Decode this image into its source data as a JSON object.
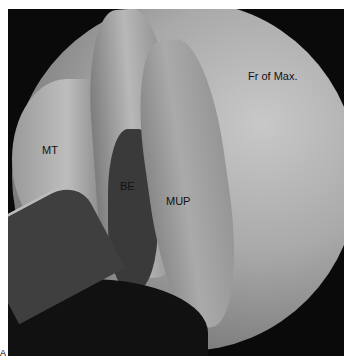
{
  "figure": {
    "labels": {
      "fr_of_max": "Fr of Max.",
      "mt": "MT",
      "be": "BE",
      "mup": "MUP"
    },
    "panel_letter": "A"
  }
}
